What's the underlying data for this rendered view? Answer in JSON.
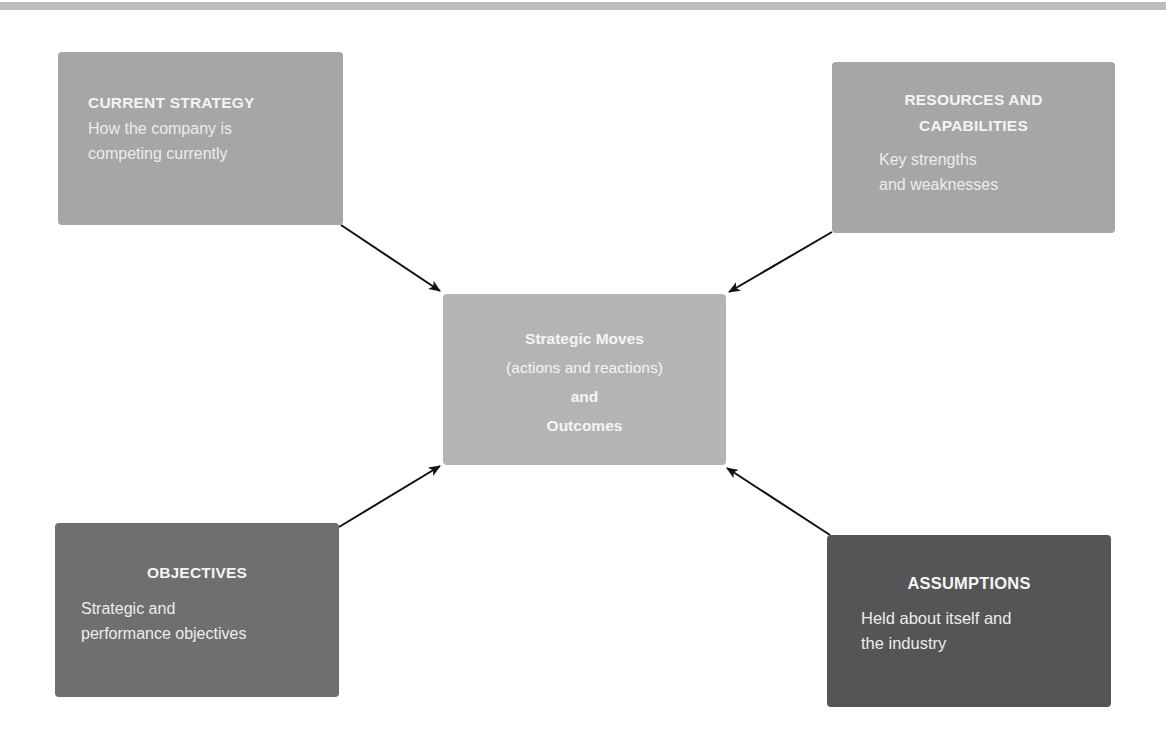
{
  "diagram": {
    "colors": {
      "current_strategy": "#a6a6a6",
      "resources_and_capabilities": "#a6a6a6",
      "center": "#b4b4b4",
      "objectives": "#6f6f6f",
      "assumptions": "#555555",
      "arrow": "#111111",
      "top_rule": "#bdbdbd"
    },
    "current_strategy": {
      "title": "CURRENT STRATEGY",
      "body_lines": [
        "How the company is",
        "competing currently"
      ]
    },
    "resources_and_capabilities": {
      "title_lines": [
        "RESOURCES AND",
        "CAPABILITIES"
      ],
      "body_lines": [
        "Key strengths",
        "and weaknesses"
      ]
    },
    "center": {
      "lines": [
        "Strategic Moves",
        "(actions and reactions)",
        "and",
        "Outcomes"
      ]
    },
    "objectives": {
      "title": "OBJECTIVES",
      "body_lines": [
        "Strategic and",
        "performance objectives"
      ]
    },
    "assumptions": {
      "title": "ASSUMPTIONS",
      "body_lines": [
        "Held about itself and",
        "the industry"
      ]
    },
    "arrows": [
      {
        "from": "current_strategy",
        "to": "center"
      },
      {
        "from": "resources_and_capabilities",
        "to": "center"
      },
      {
        "from": "objectives",
        "to": "center"
      },
      {
        "from": "assumptions",
        "to": "center"
      }
    ]
  }
}
